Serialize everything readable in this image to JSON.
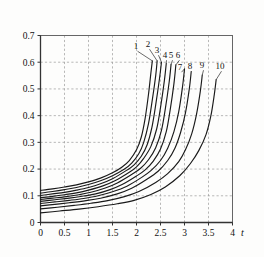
{
  "chart_data": {
    "type": "line",
    "title": "",
    "subtitle": "",
    "xlabel": "t",
    "ylabel": "q (R°)",
    "ylabel_symbol": "q",
    "ylabel_unit": "(R°)",
    "xlim": [
      0,
      4
    ],
    "ylim": [
      0,
      0.7
    ],
    "grid": true,
    "legend_position": "inline-curve-labels",
    "xticks": [
      0,
      0.5,
      1,
      1.5,
      2,
      2.5,
      3,
      3.5,
      4
    ],
    "xticklabels": [
      "0",
      "0.5",
      "1",
      "1.5",
      "2",
      "2.5",
      "3",
      "3.5",
      "4"
    ],
    "yticks": [
      0,
      0.1,
      0.2,
      0.3,
      0.4,
      0.5,
      0.6,
      0.7
    ],
    "yticklabels": [
      "0",
      "0.1",
      "0.2",
      "0.3",
      "0.4",
      "0.5",
      "0.6",
      "0.7"
    ],
    "series": [
      {
        "name": "1",
        "label": "1",
        "x": [
          0,
          0.25,
          0.5,
          0.75,
          1.0,
          1.25,
          1.5,
          1.7,
          1.85,
          2.0,
          2.1,
          2.18,
          2.25,
          2.3,
          2.33
        ],
        "values": [
          0.12,
          0.126,
          0.133,
          0.141,
          0.152,
          0.166,
          0.186,
          0.208,
          0.232,
          0.272,
          0.32,
          0.39,
          0.48,
          0.56,
          0.605
        ]
      },
      {
        "name": "2",
        "label": "2",
        "x": [
          0,
          0.25,
          0.5,
          0.75,
          1.0,
          1.25,
          1.5,
          1.75,
          1.9,
          2.05,
          2.15,
          2.25,
          2.33,
          2.4,
          2.43
        ],
        "values": [
          0.11,
          0.116,
          0.123,
          0.131,
          0.142,
          0.156,
          0.175,
          0.2,
          0.222,
          0.258,
          0.3,
          0.37,
          0.46,
          0.55,
          0.605
        ]
      },
      {
        "name": "3",
        "label": "3",
        "x": [
          0,
          0.25,
          0.5,
          0.75,
          1.0,
          1.25,
          1.5,
          1.8,
          1.95,
          2.1,
          2.22,
          2.32,
          2.4,
          2.48,
          2.52
        ],
        "values": [
          0.101,
          0.107,
          0.113,
          0.121,
          0.131,
          0.145,
          0.164,
          0.196,
          0.216,
          0.248,
          0.29,
          0.355,
          0.44,
          0.54,
          0.6
        ]
      },
      {
        "name": "4",
        "label": "4",
        "x": [
          0,
          0.25,
          0.5,
          0.75,
          1.0,
          1.3,
          1.55,
          1.85,
          2.0,
          2.15,
          2.3,
          2.42,
          2.5,
          2.58,
          2.62
        ],
        "values": [
          0.093,
          0.098,
          0.104,
          0.111,
          0.121,
          0.137,
          0.156,
          0.188,
          0.208,
          0.24,
          0.285,
          0.35,
          0.43,
          0.53,
          0.595
        ]
      },
      {
        "name": "5",
        "label": "5",
        "x": [
          0,
          0.25,
          0.5,
          0.8,
          1.05,
          1.35,
          1.6,
          1.9,
          2.08,
          2.25,
          2.4,
          2.52,
          2.6,
          2.68,
          2.72
        ],
        "values": [
          0.086,
          0.091,
          0.096,
          0.104,
          0.113,
          0.129,
          0.148,
          0.18,
          0.202,
          0.235,
          0.28,
          0.345,
          0.425,
          0.525,
          0.592
        ]
      },
      {
        "name": "6",
        "label": "6",
        "x": [
          0,
          0.3,
          0.6,
          0.9,
          1.15,
          1.45,
          1.7,
          2.0,
          2.18,
          2.35,
          2.5,
          2.62,
          2.7,
          2.78,
          2.82
        ],
        "values": [
          0.079,
          0.085,
          0.091,
          0.099,
          0.107,
          0.123,
          0.142,
          0.174,
          0.197,
          0.23,
          0.275,
          0.34,
          0.42,
          0.52,
          0.59
        ]
      },
      {
        "name": "7",
        "label": "7",
        "x": [
          0,
          0.3,
          0.6,
          0.9,
          1.2,
          1.5,
          1.8,
          2.1,
          2.3,
          2.5,
          2.65,
          2.78,
          2.88,
          2.96,
          3.0
        ],
        "values": [
          0.071,
          0.077,
          0.083,
          0.09,
          0.1,
          0.115,
          0.136,
          0.168,
          0.194,
          0.232,
          0.278,
          0.34,
          0.415,
          0.51,
          0.575
        ]
      },
      {
        "name": "8",
        "label": "8",
        "x": [
          0,
          0.3,
          0.6,
          0.95,
          1.25,
          1.6,
          1.9,
          2.2,
          2.45,
          2.65,
          2.8,
          2.92,
          3.02,
          3.1,
          3.14
        ],
        "values": [
          0.062,
          0.068,
          0.074,
          0.082,
          0.091,
          0.107,
          0.128,
          0.16,
          0.192,
          0.232,
          0.278,
          0.338,
          0.41,
          0.5,
          0.565
        ]
      },
      {
        "name": "9",
        "label": "9",
        "x": [
          0,
          0.35,
          0.7,
          1.05,
          1.4,
          1.75,
          2.05,
          2.4,
          2.65,
          2.88,
          3.02,
          3.15,
          3.25,
          3.33,
          3.37
        ],
        "values": [
          0.051,
          0.057,
          0.064,
          0.072,
          0.082,
          0.097,
          0.116,
          0.15,
          0.183,
          0.228,
          0.272,
          0.332,
          0.405,
          0.492,
          0.552
        ]
      },
      {
        "name": "10",
        "label": "10",
        "x": [
          0,
          0.4,
          0.8,
          1.2,
          1.6,
          1.95,
          2.3,
          2.6,
          2.9,
          3.12,
          3.3,
          3.45,
          3.55,
          3.62,
          3.66
        ],
        "values": [
          0.036,
          0.043,
          0.05,
          0.059,
          0.07,
          0.083,
          0.105,
          0.133,
          0.175,
          0.22,
          0.27,
          0.33,
          0.4,
          0.478,
          0.535
        ]
      }
    ]
  },
  "axes": {
    "x_axis_symbol": "t",
    "y_axis_text": "q (R°)"
  }
}
